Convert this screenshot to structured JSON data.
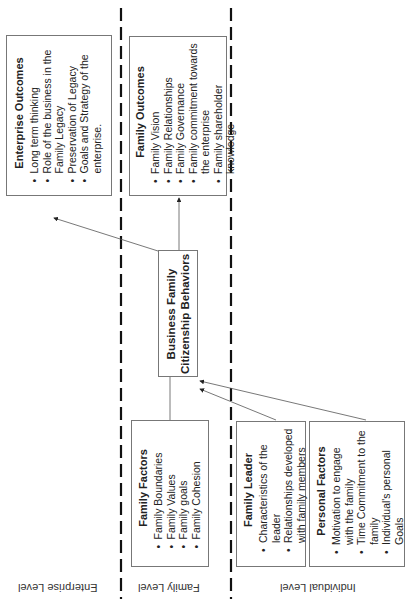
{
  "levels": [
    {
      "label": "Enterprise Level"
    },
    {
      "label": "Family Level"
    },
    {
      "label": "Individual Level"
    }
  ],
  "boxes": {
    "enterprise_outcomes": {
      "title": "Enterprise Outcomes",
      "items": [
        "Long term thinking",
        "Role of the business in the Family Legacy",
        "Preservation of Legacy",
        "Goals and Strategy of the enterprise."
      ]
    },
    "family_outcomes": {
      "title": "Family Outcomes",
      "items": [
        "Family Vision",
        "Family Relationships",
        "Family Governance",
        "Family commitment towards the enterprise",
        "Family shareholder knowledge"
      ]
    },
    "business_family": {
      "title_line1": "Business Family",
      "title_line2": "Citizenship Behaviors"
    },
    "family_factors": {
      "title": "Family Factors",
      "items": [
        "Family Boundaries",
        "Family Values",
        "Family goals",
        "Family Cohesion"
      ]
    },
    "family_leader": {
      "title": "Family Leader",
      "items": [
        "Characteristics of the leader",
        "Relationships developed with family members"
      ]
    },
    "personal_factors": {
      "title": "Personal Factors",
      "items": [
        "Motivation to engage with the family",
        "Time Commitment to the family",
        "Individual's personal Goals"
      ]
    }
  },
  "colors": {
    "line": "#555555",
    "dash": "#111111",
    "border": "#777777"
  }
}
